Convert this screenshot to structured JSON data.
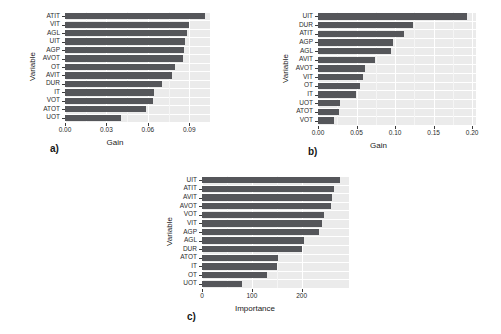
{
  "figure": {
    "background": "#ffffff",
    "bar_color": "#55565a",
    "panel_background": "#ebebeb",
    "gridline_color": "#ffffff"
  },
  "chart_data": [
    {
      "id": "a",
      "type": "bar",
      "orientation": "horizontal",
      "title": "",
      "panel_letter": "a)",
      "xlabel": "Gain",
      "ylabel": "Variable",
      "xlim": [
        0,
        0.105
      ],
      "xticks": [
        0.0,
        0.03,
        0.06,
        0.09
      ],
      "xticklabels": [
        "0.00",
        "0.03",
        "0.06",
        "0.09"
      ],
      "grid": true,
      "legend": "none",
      "categories": [
        "ATIT",
        "VIT",
        "AGL",
        "UIT",
        "AGP",
        "AVOT",
        "OT",
        "AVIT",
        "DUR",
        "IT",
        "VOT",
        "ATOT",
        "UOT"
      ],
      "values": [
        0.1015,
        0.09,
        0.088,
        0.087,
        0.0862,
        0.0855,
        0.08,
        0.0775,
        0.07,
        0.0645,
        0.0635,
        0.059,
        0.0405
      ]
    },
    {
      "id": "b",
      "type": "bar",
      "orientation": "horizontal",
      "title": "",
      "panel_letter": "b)",
      "xlabel": "Gain",
      "ylabel": "Variable",
      "xlim": [
        0,
        0.205
      ],
      "xticks": [
        0.0,
        0.05,
        0.1,
        0.15,
        0.2
      ],
      "xticklabels": [
        "0.00",
        "0.05",
        "0.10",
        "0.15",
        "0.20"
      ],
      "grid": true,
      "legend": "none",
      "categories": [
        "UIT",
        "DUR",
        "ATIT",
        "AGP",
        "AGL",
        "AVIT",
        "AVOT",
        "VIT",
        "OT",
        "IT",
        "UOT",
        "ATOT",
        "VOT"
      ],
      "values": [
        0.193,
        0.1235,
        0.1115,
        0.0975,
        0.095,
        0.074,
        0.061,
        0.058,
        0.054,
        0.049,
        0.0285,
        0.027,
        0.0205
      ]
    },
    {
      "id": "c",
      "type": "bar",
      "orientation": "horizontal",
      "title": "",
      "panel_letter": "c)",
      "xlabel": "Importance",
      "ylabel": "Variable",
      "xlim": [
        0,
        295
      ],
      "xticks": [
        0,
        100,
        200
      ],
      "xticklabels": [
        "0",
        "100",
        "200"
      ],
      "grid": true,
      "legend": "none",
      "categories": [
        "UIT",
        "ATIT",
        "AVIT",
        "AVOT",
        "VOT",
        "VIT",
        "AGP",
        "AGL",
        "DUR",
        "ATOT",
        "IT",
        "OT",
        "UOT"
      ],
      "values": [
        277,
        265,
        261,
        258,
        244,
        240,
        234,
        205,
        200,
        152,
        150,
        131,
        81
      ]
    }
  ]
}
